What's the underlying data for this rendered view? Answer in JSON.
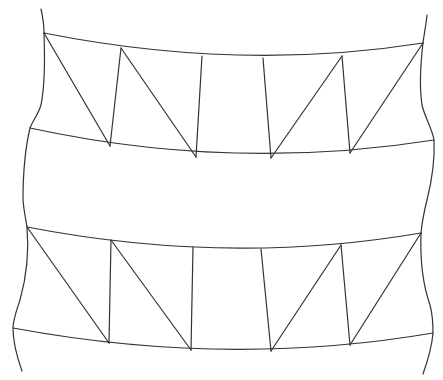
{
  "diagram": {
    "type": "line-drawing",
    "background": "#ffffff",
    "stroke": "#333333",
    "stroke_width": 1.2,
    "outline": {
      "left": "M41,9 C43,18 44,26 44,33 C45,60 45,85 41,105 C38,115 32,122 30,128 C26,145 23,170 23,200 C24,212 26,220 27,227 C29,250 27,275 20,300 C16,312 13,320 13,328 C13,342 17,357 22,371",
      "right": "M427,15 C426,25 424,35 423,43 C421,60 419,85 422,105 C425,118 432,128 434,140 C435,160 432,180 427,200 C424,212 422,222 421,233 C420,260 423,285 430,305 C433,316 433,325 433,333 C432,345 428,360 423,374"
    },
    "bands": [
      {
        "name": "upper-band",
        "top_curve": "M44,33 Q240,72 423,43",
        "bottom_curve": "M30,128 Q232,172 434,140",
        "struts": [
          {
            "x1": 44,
            "y1": 33,
            "x2": 110,
            "y2": 146
          },
          {
            "x1": 121,
            "y1": 48,
            "x2": 110,
            "y2": 146
          },
          {
            "x1": 121,
            "y1": 48,
            "x2": 196,
            "y2": 157
          },
          {
            "x1": 202,
            "y1": 56,
            "x2": 196,
            "y2": 157
          },
          {
            "x1": 263,
            "y1": 58,
            "x2": 271,
            "y2": 158
          },
          {
            "x1": 342,
            "y1": 56,
            "x2": 271,
            "y2": 158
          },
          {
            "x1": 342,
            "y1": 56,
            "x2": 350,
            "y2": 153
          },
          {
            "x1": 423,
            "y1": 43,
            "x2": 350,
            "y2": 153
          }
        ]
      },
      {
        "name": "lower-band",
        "top_curve": "M27,227 Q228,266 421,233",
        "bottom_curve": "M13,328 Q228,368 433,333",
        "struts": [
          {
            "x1": 27,
            "y1": 227,
            "x2": 109,
            "y2": 343
          },
          {
            "x1": 111,
            "y1": 240,
            "x2": 109,
            "y2": 343
          },
          {
            "x1": 111,
            "y1": 240,
            "x2": 191,
            "y2": 350
          },
          {
            "x1": 193,
            "y1": 247,
            "x2": 191,
            "y2": 350
          },
          {
            "x1": 261,
            "y1": 249,
            "x2": 271,
            "y2": 351
          },
          {
            "x1": 341,
            "y1": 245,
            "x2": 271,
            "y2": 351
          },
          {
            "x1": 341,
            "y1": 245,
            "x2": 350,
            "y2": 345
          },
          {
            "x1": 421,
            "y1": 233,
            "x2": 350,
            "y2": 345
          }
        ]
      }
    ]
  }
}
